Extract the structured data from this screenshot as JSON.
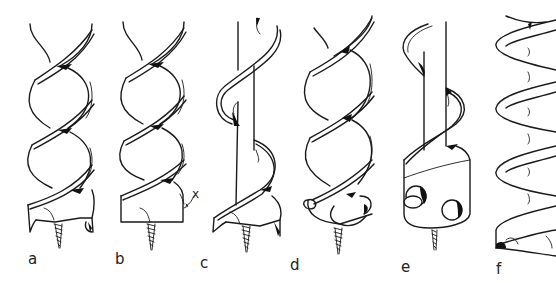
{
  "figure": {
    "labels": {
      "a": "a",
      "b": "b",
      "c": "c",
      "d": "d",
      "e": "e",
      "f": "f"
    },
    "annotation_x": "x"
  }
}
